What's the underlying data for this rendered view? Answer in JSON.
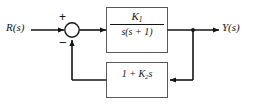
{
  "diagram": {
    "type": "control-system-block-diagram",
    "background_color": "#ffffff",
    "line_color": "#141414",
    "block_border_color": "#5a5a5a",
    "block_fill_color": "#ffffff",
    "signals": {
      "input_label": "R(s)",
      "output_label": "Y(s)"
    },
    "summing_junction": {
      "name": "summing-junction",
      "plus_sign": "+",
      "minus_sign": "−",
      "plus_input": "R(s)",
      "minus_input": "feedback"
    },
    "blocks": [
      {
        "id": "forward-block",
        "role": "forward-path",
        "transfer_function": "K1/(s(s+1))",
        "numerator": "K",
        "numerator_subscript": "1",
        "denominator": "s(s + 1)"
      },
      {
        "id": "feedback-block",
        "role": "feedback-path",
        "transfer_function": "1 + K2 s",
        "expression_prefix": "1 + ",
        "gain_symbol": "K",
        "gain_subscript": "2",
        "expression_suffix": "s"
      }
    ],
    "nodes": {
      "takeoff_point": "output-takeoff-node"
    }
  }
}
